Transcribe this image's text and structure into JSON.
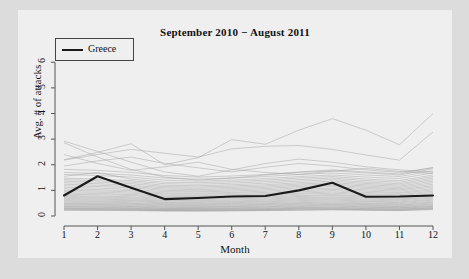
{
  "chart_data": {
    "type": "line",
    "title": "September 2010 − August 2011",
    "xlabel": "Month",
    "ylabel": "Avg. # of attacks",
    "xlim": [
      1,
      12
    ],
    "ylim": [
      0,
      6.4
    ],
    "xticks": [
      "1",
      "2",
      "3",
      "4",
      "5",
      "6",
      "7",
      "8",
      "9",
      "10",
      "11",
      "12"
    ],
    "yticks": [
      "0",
      "1",
      "2",
      "3",
      "4",
      "5",
      "6"
    ],
    "grid": false,
    "legend": {
      "position": "top-left",
      "entries": [
        "Greece"
      ]
    },
    "x": [
      1,
      2,
      3,
      4,
      5,
      6,
      7,
      8,
      9,
      10,
      11,
      12
    ],
    "highlight_series": {
      "name": "Greece",
      "color": "#1a1a1a",
      "values": [
        0.8,
        1.55,
        1.1,
        0.66,
        0.7,
        0.76,
        0.78,
        1.0,
        1.3,
        0.75,
        0.76,
        0.8
      ]
    },
    "background_series": [
      {
        "name": "bg-01",
        "values": [
          2.92,
          2.52,
          2.1,
          1.72,
          1.55,
          1.8,
          2.05,
          2.22,
          2.1,
          1.92,
          1.8,
          1.72
        ]
      },
      {
        "name": "bg-02",
        "values": [
          2.2,
          2.48,
          2.82,
          2.0,
          2.28,
          2.98,
          2.8,
          3.35,
          3.8,
          3.35,
          2.78,
          4.0
        ]
      },
      {
        "name": "bg-03",
        "values": [
          2.18,
          2.4,
          2.6,
          2.45,
          2.3,
          2.62,
          2.72,
          2.75,
          2.6,
          2.38,
          2.18,
          3.28
        ]
      },
      {
        "name": "bg-04",
        "values": [
          2.86,
          2.3,
          1.82,
          1.52,
          1.4,
          1.48,
          1.6,
          1.72,
          1.8,
          1.72,
          1.64,
          1.9
        ]
      },
      {
        "name": "bg-05",
        "values": [
          1.82,
          1.78,
          1.7,
          1.58,
          1.52,
          1.56,
          1.62,
          1.7,
          1.76,
          1.68,
          1.6,
          1.84
        ]
      },
      {
        "name": "bg-06",
        "values": [
          1.7,
          1.66,
          1.6,
          1.48,
          1.44,
          1.48,
          1.54,
          1.62,
          1.68,
          1.6,
          1.54,
          1.76
        ]
      },
      {
        "name": "bg-07",
        "values": [
          1.62,
          1.58,
          1.52,
          1.4,
          1.36,
          1.4,
          1.46,
          1.54,
          1.6,
          1.52,
          1.46,
          1.68
        ]
      },
      {
        "name": "bg-08",
        "values": [
          1.55,
          1.7,
          1.44,
          1.32,
          1.3,
          1.34,
          1.4,
          1.48,
          1.54,
          1.44,
          1.38,
          1.6
        ]
      },
      {
        "name": "bg-09",
        "values": [
          1.48,
          1.44,
          1.38,
          1.26,
          1.24,
          1.28,
          1.34,
          1.42,
          1.48,
          1.38,
          1.32,
          1.54
        ]
      },
      {
        "name": "bg-10",
        "values": [
          1.42,
          1.38,
          1.32,
          1.2,
          1.18,
          1.22,
          1.28,
          1.36,
          1.42,
          1.32,
          1.26,
          1.48
        ]
      },
      {
        "name": "bg-11",
        "values": [
          1.36,
          1.32,
          1.26,
          1.15,
          1.13,
          1.17,
          1.22,
          1.3,
          1.36,
          1.27,
          1.21,
          1.42
        ]
      },
      {
        "name": "bg-12",
        "values": [
          1.3,
          1.26,
          1.2,
          1.1,
          1.08,
          1.12,
          1.17,
          1.25,
          1.3,
          1.22,
          1.16,
          1.36
        ]
      },
      {
        "name": "bg-13",
        "values": [
          1.24,
          1.2,
          1.15,
          1.05,
          1.03,
          1.07,
          1.12,
          1.2,
          1.25,
          1.17,
          1.11,
          1.3
        ]
      },
      {
        "name": "bg-14",
        "values": [
          1.18,
          1.15,
          1.1,
          1.0,
          0.98,
          1.02,
          1.07,
          1.15,
          1.2,
          1.12,
          1.06,
          1.24
        ]
      },
      {
        "name": "bg-15",
        "values": [
          1.12,
          1.09,
          1.04,
          0.95,
          0.94,
          0.97,
          1.02,
          1.1,
          1.15,
          1.07,
          1.02,
          1.18
        ]
      },
      {
        "name": "bg-16",
        "values": [
          1.06,
          1.03,
          0.99,
          0.9,
          0.89,
          0.92,
          0.97,
          1.04,
          1.09,
          1.02,
          0.97,
          1.13
        ]
      },
      {
        "name": "bg-17",
        "values": [
          1.0,
          0.98,
          0.94,
          0.86,
          0.85,
          0.88,
          0.92,
          0.99,
          1.04,
          0.97,
          0.92,
          1.07
        ]
      },
      {
        "name": "bg-18",
        "values": [
          0.95,
          0.93,
          0.89,
          0.81,
          0.8,
          0.83,
          0.87,
          0.94,
          0.99,
          0.92,
          0.88,
          1.02
        ]
      },
      {
        "name": "bg-19",
        "values": [
          0.9,
          0.88,
          0.84,
          0.77,
          0.76,
          0.79,
          0.83,
          0.89,
          0.94,
          0.87,
          0.83,
          0.97
        ]
      },
      {
        "name": "bg-20",
        "values": [
          0.85,
          0.83,
          0.8,
          0.73,
          0.72,
          0.75,
          0.78,
          0.85,
          0.89,
          0.83,
          0.79,
          0.92
        ]
      },
      {
        "name": "bg-21",
        "values": [
          0.8,
          0.78,
          0.75,
          0.69,
          0.68,
          0.71,
          0.74,
          0.8,
          0.84,
          0.78,
          0.74,
          0.87
        ]
      },
      {
        "name": "bg-22",
        "values": [
          0.76,
          0.74,
          0.71,
          0.65,
          0.64,
          0.67,
          0.7,
          0.76,
          0.8,
          0.74,
          0.7,
          0.82
        ]
      },
      {
        "name": "bg-23",
        "values": [
          0.72,
          0.7,
          0.67,
          0.61,
          0.6,
          0.63,
          0.66,
          0.72,
          0.75,
          0.7,
          0.66,
          0.78
        ]
      },
      {
        "name": "bg-24",
        "values": [
          0.68,
          0.66,
          0.63,
          0.58,
          0.57,
          0.59,
          0.62,
          0.68,
          0.71,
          0.66,
          0.63,
          0.74
        ]
      },
      {
        "name": "bg-25",
        "values": [
          0.64,
          0.62,
          0.6,
          0.54,
          0.53,
          0.56,
          0.58,
          0.64,
          0.67,
          0.62,
          0.59,
          0.7
        ]
      },
      {
        "name": "bg-26",
        "values": [
          0.6,
          0.58,
          0.56,
          0.51,
          0.5,
          0.52,
          0.55,
          0.6,
          0.63,
          0.58,
          0.55,
          0.66
        ]
      },
      {
        "name": "bg-27",
        "values": [
          0.56,
          0.55,
          0.52,
          0.48,
          0.47,
          0.49,
          0.51,
          0.56,
          0.59,
          0.55,
          0.52,
          0.62
        ]
      },
      {
        "name": "bg-28",
        "values": [
          0.52,
          0.51,
          0.49,
          0.45,
          0.44,
          0.46,
          0.48,
          0.52,
          0.55,
          0.51,
          0.48,
          0.58
        ]
      },
      {
        "name": "bg-29",
        "values": [
          0.49,
          0.48,
          0.46,
          0.42,
          0.41,
          0.43,
          0.45,
          0.49,
          0.51,
          0.48,
          0.45,
          0.54
        ]
      },
      {
        "name": "bg-30",
        "values": [
          0.46,
          0.45,
          0.43,
          0.39,
          0.38,
          0.4,
          0.42,
          0.46,
          0.48,
          0.45,
          0.42,
          0.51
        ]
      },
      {
        "name": "bg-31",
        "values": [
          0.43,
          0.42,
          0.4,
          0.36,
          0.36,
          0.37,
          0.39,
          0.43,
          0.45,
          0.42,
          0.39,
          0.47
        ]
      },
      {
        "name": "bg-32",
        "values": [
          0.4,
          0.39,
          0.37,
          0.34,
          0.33,
          0.35,
          0.36,
          0.4,
          0.42,
          0.39,
          0.37,
          0.44
        ]
      },
      {
        "name": "bg-33",
        "values": [
          0.37,
          0.36,
          0.35,
          0.31,
          0.31,
          0.32,
          0.34,
          0.37,
          0.39,
          0.36,
          0.34,
          0.41
        ]
      },
      {
        "name": "bg-34",
        "values": [
          0.35,
          0.34,
          0.32,
          0.29,
          0.29,
          0.3,
          0.31,
          0.34,
          0.36,
          0.34,
          0.32,
          0.38
        ]
      },
      {
        "name": "bg-35",
        "values": [
          0.32,
          0.31,
          0.3,
          0.27,
          0.27,
          0.28,
          0.29,
          0.32,
          0.34,
          0.31,
          0.3,
          0.36
        ]
      },
      {
        "name": "bg-36",
        "values": [
          0.3,
          0.29,
          0.28,
          0.25,
          0.25,
          0.26,
          0.27,
          0.3,
          0.31,
          0.29,
          0.27,
          0.33
        ]
      },
      {
        "name": "bg-37",
        "values": [
          0.28,
          0.27,
          0.26,
          0.24,
          0.23,
          0.24,
          0.25,
          0.28,
          0.29,
          0.27,
          0.26,
          0.31
        ]
      },
      {
        "name": "bg-38",
        "values": [
          0.26,
          0.25,
          0.24,
          0.22,
          0.22,
          0.23,
          0.24,
          0.26,
          0.27,
          0.25,
          0.24,
          0.29
        ]
      },
      {
        "name": "bg-39",
        "values": [
          0.24,
          0.23,
          0.23,
          0.21,
          0.2,
          0.21,
          0.22,
          0.24,
          0.25,
          0.24,
          0.22,
          0.27
        ]
      },
      {
        "name": "bg-40",
        "values": [
          0.22,
          0.22,
          0.21,
          0.19,
          0.19,
          0.2,
          0.21,
          0.22,
          0.24,
          0.22,
          0.21,
          0.25
        ]
      },
      {
        "name": "bg-41",
        "values": [
          2.4,
          2.05,
          1.78,
          1.92,
          2.1,
          1.82,
          1.7,
          1.62,
          1.75,
          1.86,
          1.74,
          1.66
        ]
      },
      {
        "name": "bg-42",
        "values": [
          1.95,
          2.15,
          2.3,
          2.05,
          1.88,
          1.72,
          1.9,
          2.05,
          1.95,
          1.8,
          1.7,
          1.88
        ]
      }
    ]
  }
}
